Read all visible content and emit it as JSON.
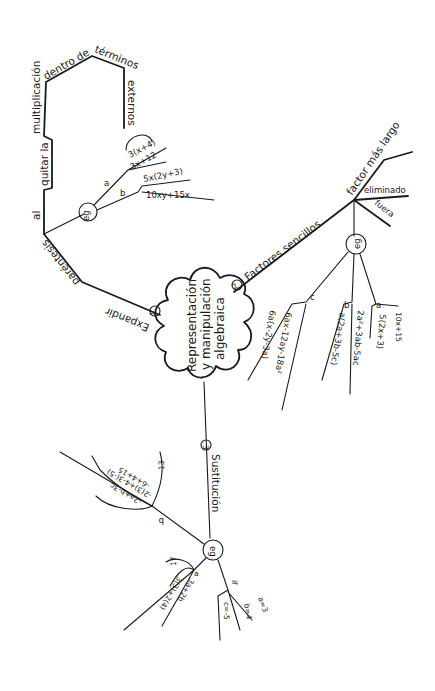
{
  "central_topic": {
    "line1": "Representación",
    "line2": "y manipulación",
    "line3": "algebraica"
  },
  "branches": [
    {
      "number": "1",
      "label": "Expandir",
      "sub_path": [
        "paréntesis",
        "al",
        "quitar la",
        "multiplicación",
        "dentro de",
        "términos",
        "externos"
      ],
      "example_node": "eg",
      "examples": [
        {
          "letter": "a",
          "expression": "3(x+4)",
          "result": "3x+12"
        },
        {
          "letter": "b",
          "expression": "5x(2y+3)",
          "result": "10xy+15x"
        }
      ]
    },
    {
      "number": "2",
      "label": "Factores sencillos",
      "sub_branches": [
        "factor más largo",
        "eliminado",
        "fuera"
      ],
      "example_node": "eg",
      "examples": [
        {
          "letter": "a",
          "expression": "10x+15",
          "result": "5(2x+3)"
        },
        {
          "letter": "b",
          "expression": "2a²+3ab-5ac",
          "result": "a(2a+3b-5c)"
        },
        {
          "letter": "c",
          "expression": "6ax-12ay-18a²",
          "result": "6a(x-2y-3a)"
        }
      ]
    },
    {
      "number": "3",
      "label": "Sustitución",
      "example_node": "eg",
      "given": {
        "label": "if",
        "values": [
          "a=3",
          "b=4",
          "c=-5"
        ]
      },
      "examples": [
        {
          "letter": "a",
          "expression": "3a+2b",
          "working": "3(3)+2(4)",
          "result": "17"
        },
        {
          "letter": "b",
          "expression": "-2a+b-3c",
          "working": "-2(3)+4-3(-5)",
          "step": "-6+4+15",
          "result": "13"
        }
      ]
    }
  ],
  "colors": {
    "ink": "#1a1a1a",
    "paper": "#ffffff"
  }
}
